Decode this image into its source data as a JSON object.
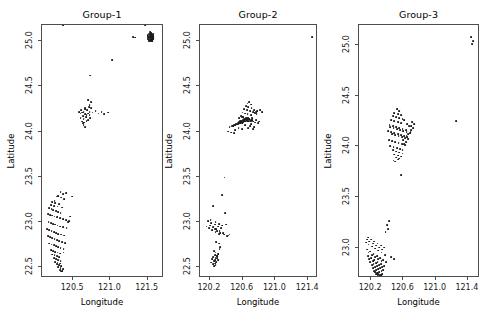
{
  "figure": {
    "width": 487,
    "height": 321,
    "background": "#ffffff",
    "point_color": "#1a1a1a",
    "frame_color": "#4d4d4d"
  },
  "chart_data": {
    "type": "scatter",
    "title": "",
    "layout": "1 row x 3 columns of small-multiple scatter panels",
    "shared_xlabel": "Longitude",
    "shared_ylabel": "Latitude",
    "grid": false,
    "legend": null,
    "panels": [
      {
        "title": "Group-1",
        "xlabel": "Longitude",
        "ylabel": "Latitude",
        "xlim": [
          120.08,
          121.72
        ],
        "ylim": [
          22.38,
          25.18
        ],
        "xticks": [
          120.5,
          121.0,
          121.5
        ],
        "yticks": [
          22.5,
          23.0,
          23.5,
          24.0,
          24.5,
          25.0
        ],
        "xtick_labels": [
          "120.5",
          "121.0",
          "121.5"
        ],
        "ytick_labels": [
          "22.5",
          "23.0",
          "23.5",
          "24.0",
          "24.5",
          "25.0"
        ],
        "n_points": 171,
        "x": [
          121.52,
          121.53,
          121.545,
          121.55,
          121.56,
          121.5,
          121.515,
          121.535,
          121.555,
          121.565,
          121.54,
          121.56,
          121.57,
          121.525,
          121.5,
          121.545,
          121.575,
          121.51,
          121.53,
          121.55,
          121.565,
          121.58,
          121.52,
          121.54,
          121.56,
          121.5,
          121.53,
          121.555,
          121.57,
          121.545,
          121.52,
          121.56,
          121.535,
          121.51,
          121.55,
          121.565,
          121.58,
          121.53,
          121.545,
          121.57,
          121.3,
          121.33,
          121.02,
          120.73,
          120.7,
          120.74,
          120.72,
          120.66,
          120.69,
          120.64,
          120.62,
          120.66,
          120.6,
          120.63,
          120.68,
          120.7,
          120.72,
          120.76,
          120.8,
          120.84,
          120.88,
          120.92,
          120.97,
          120.6,
          120.64,
          120.67,
          120.7,
          120.73,
          120.62,
          120.65,
          120.68,
          120.58,
          120.61,
          120.66,
          120.71,
          120.74,
          120.64,
          120.66,
          120.63,
          120.72,
          120.33,
          120.36,
          120.3,
          120.28,
          120.34,
          120.38,
          120.25,
          120.22,
          120.26,
          120.31,
          120.2,
          120.24,
          120.29,
          120.35,
          120.4,
          120.18,
          120.21,
          120.23,
          120.27,
          120.3,
          120.33,
          120.16,
          120.19,
          120.22,
          120.25,
          120.28,
          120.32,
          120.36,
          120.4,
          120.44,
          120.48,
          120.17,
          120.2,
          120.23,
          120.26,
          120.29,
          120.32,
          120.36,
          120.41,
          120.46,
          120.15,
          120.18,
          120.21,
          120.24,
          120.27,
          120.3,
          120.34,
          120.38,
          120.43,
          120.16,
          120.19,
          120.22,
          120.25,
          120.28,
          120.31,
          120.35,
          120.39,
          120.18,
          120.21,
          120.24,
          120.27,
          120.3,
          120.33,
          120.37,
          120.2,
          120.23,
          120.26,
          120.29,
          120.32,
          120.22,
          120.25,
          120.28,
          120.31,
          120.24,
          120.27,
          120.3,
          120.33,
          120.26,
          120.29,
          120.32,
          120.28,
          120.31,
          120.34,
          120.3,
          120.33,
          120.36,
          120.32,
          120.35,
          120.34,
          120.37,
          120.36,
          121.47
        ],
        "y": [
          25.06,
          25.04,
          25.07,
          25.02,
          25.05,
          25.03,
          25.08,
          25.01,
          25.06,
          25.03,
          25.09,
          25.0,
          25.05,
          25.04,
          25.07,
          25.02,
          25.06,
          25.05,
          25.03,
          25.08,
          25.01,
          25.04,
          25.0,
          25.07,
          25.02,
          25.06,
          25.05,
          25.03,
          25.08,
          25.09,
          25.01,
          25.07,
          25.04,
          25.02,
          25.06,
          25.05,
          25.03,
          25.1,
          25.0,
          25.02,
          25.05,
          25.04,
          24.79,
          24.62,
          24.35,
          24.33,
          24.29,
          24.26,
          24.24,
          24.22,
          24.21,
          24.19,
          24.2,
          24.17,
          24.18,
          24.2,
          24.22,
          24.21,
          24.23,
          24.2,
          24.22,
          24.19,
          24.21,
          24.15,
          24.14,
          24.16,
          24.13,
          24.15,
          24.11,
          24.1,
          24.12,
          24.22,
          24.24,
          24.25,
          24.27,
          24.26,
          24.07,
          24.05,
          24.09,
          24.18,
          23.33,
          23.31,
          23.29,
          23.28,
          23.27,
          23.25,
          23.23,
          23.22,
          23.21,
          23.2,
          23.19,
          23.18,
          23.17,
          23.16,
          23.32,
          23.15,
          23.14,
          23.13,
          23.12,
          23.11,
          23.1,
          23.09,
          23.08,
          23.07,
          23.06,
          23.05,
          23.04,
          23.03,
          23.02,
          23.01,
          23.28,
          23.0,
          22.99,
          22.98,
          22.97,
          22.96,
          22.95,
          22.94,
          22.93,
          23.06,
          22.92,
          22.91,
          22.9,
          22.89,
          22.88,
          22.87,
          22.86,
          22.85,
          23.0,
          22.84,
          22.83,
          22.82,
          22.81,
          22.8,
          22.79,
          22.78,
          22.77,
          22.76,
          22.75,
          22.74,
          22.73,
          22.72,
          22.71,
          22.7,
          22.69,
          22.68,
          22.67,
          22.66,
          22.65,
          22.64,
          22.63,
          22.62,
          22.61,
          22.6,
          22.59,
          22.58,
          22.57,
          22.56,
          22.55,
          22.54,
          22.53,
          22.52,
          22.51,
          22.5,
          22.49,
          22.48,
          22.47,
          22.46,
          22.45,
          22.66
        ]
      },
      {
        "title": "Group-2",
        "xlabel": "Longitude",
        "ylabel": "Latitude",
        "xlim": [
          120.08,
          121.52
        ],
        "ylim": [
          22.38,
          25.18
        ],
        "xticks": [
          120.2,
          120.6,
          121.0,
          121.4
        ],
        "yticks": [
          22.5,
          23.0,
          23.5,
          24.0,
          24.5,
          25.0
        ],
        "xtick_labels": [
          "120.2",
          "120.6",
          "121.0",
          "121.4"
        ],
        "ytick_labels": [
          "22.5",
          "23.0",
          "23.5",
          "24.0",
          "24.5",
          "25.0"
        ],
        "n_points": 142,
        "x": [
          121.45,
          120.68,
          120.66,
          120.7,
          120.64,
          120.67,
          120.71,
          120.62,
          120.65,
          120.69,
          120.73,
          120.6,
          120.63,
          120.66,
          120.7,
          120.74,
          120.58,
          120.61,
          120.64,
          120.68,
          120.72,
          120.76,
          120.56,
          120.59,
          120.62,
          120.66,
          120.7,
          120.74,
          120.78,
          120.57,
          120.6,
          120.63,
          120.67,
          120.71,
          120.75,
          120.55,
          120.58,
          120.62,
          120.65,
          120.69,
          120.73,
          120.77,
          120.81,
          120.54,
          120.57,
          120.61,
          120.64,
          120.68,
          120.72,
          120.76,
          120.8,
          120.84,
          120.56,
          120.59,
          120.63,
          120.67,
          120.71,
          120.75,
          120.79,
          120.52,
          120.55,
          120.58,
          120.62,
          120.66,
          120.7,
          120.74,
          120.5,
          120.53,
          120.57,
          120.61,
          120.65,
          120.69,
          120.73,
          120.48,
          120.51,
          120.55,
          120.59,
          120.63,
          120.67,
          120.44,
          120.47,
          120.51,
          120.55,
          120.59,
          120.42,
          120.46,
          120.5,
          120.24,
          120.21,
          120.27,
          120.31,
          120.35,
          120.18,
          120.22,
          120.26,
          120.3,
          120.34,
          120.38,
          120.2,
          120.24,
          120.28,
          120.32,
          120.36,
          120.4,
          120.44,
          120.16,
          120.19,
          120.23,
          120.27,
          120.31,
          120.35,
          120.39,
          120.43,
          120.26,
          120.29,
          120.33,
          120.37,
          120.41,
          120.28,
          120.31,
          120.25,
          120.27,
          120.3,
          120.33,
          120.26,
          120.29,
          120.32,
          120.24,
          120.27,
          120.3,
          120.23,
          120.26,
          120.29,
          120.25,
          120.28,
          120.22,
          120.26,
          120.29,
          120.24,
          120.27,
          120.3,
          120.25
        ],
        "y": [
          25.05,
          24.33,
          24.31,
          24.3,
          24.28,
          24.27,
          24.26,
          24.25,
          24.24,
          24.23,
          24.22,
          24.21,
          24.2,
          24.19,
          24.18,
          24.24,
          24.17,
          24.16,
          24.15,
          24.14,
          24.13,
          24.22,
          24.15,
          24.16,
          24.14,
          24.15,
          24.13,
          24.21,
          24.23,
          24.12,
          24.13,
          24.14,
          24.15,
          24.12,
          24.2,
          24.11,
          24.12,
          24.13,
          24.14,
          24.12,
          24.11,
          24.19,
          24.24,
          24.1,
          24.11,
          24.12,
          24.13,
          24.14,
          24.15,
          24.13,
          24.11,
          24.22,
          24.09,
          24.1,
          24.11,
          24.12,
          24.13,
          24.1,
          24.09,
          24.08,
          24.09,
          24.1,
          24.11,
          24.12,
          24.08,
          24.05,
          24.07,
          24.08,
          24.09,
          24.1,
          24.11,
          24.06,
          24.03,
          24.06,
          24.07,
          24.08,
          24.09,
          24.07,
          24.04,
          24.05,
          24.06,
          24.02,
          24.04,
          24.03,
          24.0,
          23.99,
          23.98,
          23.18,
          23.02,
          23.0,
          22.98,
          22.96,
          23.01,
          22.99,
          22.97,
          22.95,
          22.93,
          23.49,
          22.96,
          22.94,
          22.92,
          22.9,
          22.88,
          22.97,
          22.86,
          22.95,
          22.93,
          22.91,
          22.89,
          22.87,
          23.3,
          23.1,
          22.85,
          22.92,
          22.9,
          22.88,
          22.86,
          22.84,
          22.78,
          22.76,
          22.68,
          22.66,
          22.64,
          22.72,
          22.63,
          22.62,
          22.7,
          22.61,
          22.6,
          22.65,
          22.59,
          22.58,
          22.62,
          22.57,
          22.56,
          22.55,
          22.54,
          22.6,
          22.53,
          22.52,
          22.58,
          22.51
        ]
      },
      {
        "title": "Group-3",
        "xlabel": "Longitude",
        "ylabel": "Latitude",
        "xlim": [
          120.05,
          121.55
        ],
        "ylim": [
          22.7,
          25.2
        ],
        "xticks": [
          120.2,
          120.6,
          121.0,
          121.4
        ],
        "yticks": [
          23.0,
          23.5,
          24.0,
          24.5,
          25.0
        ],
        "xtick_labels": [
          "120.2",
          "120.6",
          "121.0",
          "121.4"
        ],
        "ytick_labels": [
          "23.0",
          "23.5",
          "24.0",
          "24.5",
          "25.0"
        ],
        "n_points": 152,
        "x": [
          121.44,
          121.46,
          121.45,
          121.25,
          120.52,
          120.55,
          120.49,
          120.53,
          120.57,
          120.47,
          120.51,
          120.55,
          120.59,
          120.45,
          120.49,
          120.53,
          120.57,
          120.61,
          120.65,
          120.43,
          120.47,
          120.51,
          120.55,
          120.59,
          120.63,
          120.67,
          120.71,
          120.41,
          120.45,
          120.49,
          120.53,
          120.57,
          120.61,
          120.65,
          120.69,
          120.73,
          120.44,
          120.48,
          120.52,
          120.56,
          120.6,
          120.64,
          120.68,
          120.72,
          120.46,
          120.5,
          120.54,
          120.58,
          120.62,
          120.66,
          120.7,
          120.42,
          120.46,
          120.5,
          120.54,
          120.58,
          120.62,
          120.66,
          120.7,
          120.44,
          120.48,
          120.52,
          120.56,
          120.6,
          120.64,
          120.47,
          120.51,
          120.55,
          120.59,
          120.63,
          120.49,
          120.53,
          120.57,
          120.61,
          120.51,
          120.55,
          120.59,
          120.53,
          120.57,
          120.48,
          120.5,
          120.15,
          120.18,
          120.22,
          120.26,
          120.3,
          120.34,
          120.38,
          120.42,
          120.16,
          120.2,
          120.24,
          120.28,
          120.32,
          120.36,
          120.4,
          120.14,
          120.17,
          120.21,
          120.25,
          120.29,
          120.33,
          120.37,
          120.41,
          120.45,
          120.49,
          120.15,
          120.19,
          120.23,
          120.27,
          120.31,
          120.35,
          120.39,
          120.17,
          120.21,
          120.25,
          120.29,
          120.33,
          120.16,
          120.2,
          120.24,
          120.28,
          120.32,
          120.36,
          120.18,
          120.22,
          120.26,
          120.3,
          120.34,
          120.19,
          120.23,
          120.27,
          120.31,
          120.35,
          120.21,
          120.25,
          120.29,
          120.33,
          120.22,
          120.26,
          120.3,
          120.34,
          120.24,
          120.28,
          120.32,
          120.25,
          120.29,
          120.33,
          120.27,
          120.31,
          120.26,
          120.3,
          120.28,
          120.32
        ],
        "y": [
          25.08,
          25.04,
          25.01,
          24.25,
          24.37,
          24.35,
          24.33,
          24.32,
          24.31,
          24.3,
          24.29,
          24.28,
          24.27,
          24.26,
          24.25,
          24.24,
          24.23,
          24.26,
          24.22,
          24.21,
          24.2,
          24.19,
          24.18,
          24.17,
          24.16,
          24.2,
          24.24,
          24.15,
          24.14,
          24.13,
          24.12,
          24.11,
          24.1,
          24.09,
          24.14,
          24.22,
          24.19,
          24.18,
          24.17,
          24.16,
          24.15,
          24.14,
          24.13,
          24.18,
          24.12,
          24.11,
          24.1,
          24.09,
          24.08,
          24.07,
          24.16,
          24.06,
          24.05,
          24.04,
          24.03,
          24.02,
          24.01,
          24.12,
          24.2,
          24.0,
          23.99,
          23.98,
          23.97,
          24.06,
          24.1,
          23.96,
          23.95,
          23.94,
          23.93,
          24.04,
          23.92,
          23.91,
          23.9,
          24.02,
          23.89,
          23.88,
          23.96,
          23.87,
          23.72,
          23.86,
          23.85,
          23.08,
          23.06,
          23.04,
          23.02,
          23.0,
          22.98,
          23.15,
          23.26,
          23.1,
          23.08,
          23.06,
          23.04,
          23.02,
          23.0,
          23.22,
          23.05,
          23.03,
          23.01,
          22.99,
          22.97,
          22.95,
          22.93,
          23.18,
          22.91,
          22.89,
          22.98,
          22.96,
          22.94,
          22.92,
          22.9,
          22.88,
          22.86,
          22.95,
          22.93,
          22.91,
          22.89,
          22.87,
          22.92,
          22.9,
          22.88,
          22.86,
          22.84,
          22.82,
          22.89,
          22.87,
          22.85,
          22.83,
          22.81,
          22.86,
          22.84,
          22.82,
          22.8,
          22.78,
          22.83,
          22.81,
          22.79,
          22.77,
          22.8,
          22.78,
          22.76,
          22.74,
          22.77,
          22.75,
          22.73,
          22.76,
          22.74,
          22.72,
          22.75,
          22.73,
          22.74,
          22.72,
          22.73,
          22.71
        ]
      }
    ]
  }
}
